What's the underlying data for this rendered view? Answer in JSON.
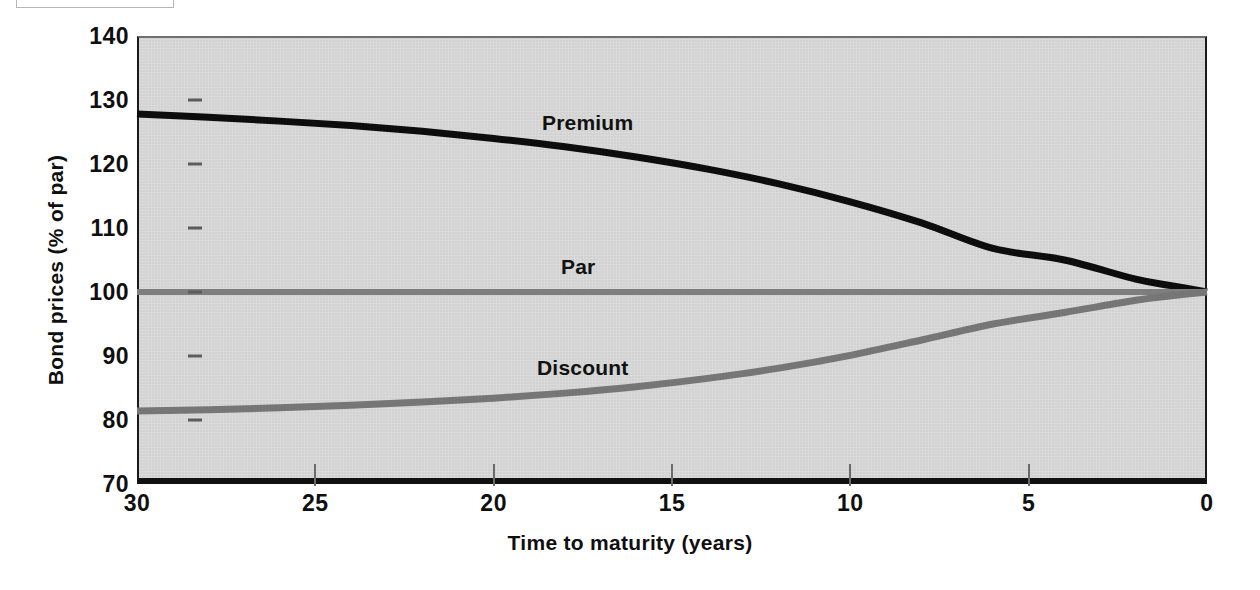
{
  "figure": {
    "background_color": "#ffffff",
    "plot_background_color": "#d5d5d5"
  },
  "axis": {
    "y_title": "Bond prices (% of par)",
    "x_title": "Time to maturity (years)",
    "y_ticks": [
      "140",
      "130",
      "120",
      "110",
      "100",
      "90",
      "80",
      "70"
    ],
    "x_ticks": [
      "30",
      "25",
      "20",
      "15",
      "10",
      "5",
      "0"
    ]
  },
  "series_labels": {
    "premium": "Premium",
    "par": "Par",
    "discount": "Discount"
  },
  "chart_data": {
    "type": "line",
    "title": "",
    "xlabel": "Time to maturity (years)",
    "ylabel": "Bond prices (% of par)",
    "xlim": [
      30,
      0
    ],
    "ylim": [
      70,
      140
    ],
    "x_reversed": true,
    "grid": false,
    "legend_position": "inline-annotations",
    "x_ticks": [
      30,
      25,
      20,
      15,
      10,
      5,
      0
    ],
    "y_ticks": [
      70,
      80,
      90,
      100,
      110,
      120,
      130,
      140
    ],
    "x": [
      30,
      28,
      26,
      24,
      22,
      20,
      18,
      16,
      14,
      12,
      10,
      8,
      6,
      4,
      2,
      1,
      0
    ],
    "series": [
      {
        "name": "Premium",
        "color": "#0d0d0d",
        "line_width": 7,
        "values": [
          127.8,
          127.3,
          126.7,
          126.0,
          125.1,
          124.0,
          122.7,
          121.1,
          119.2,
          116.9,
          114.1,
          110.8,
          106.8,
          105.0,
          102.0,
          101.0,
          100.0
        ]
      },
      {
        "name": "Par",
        "color": "#7e7e7e",
        "line_width": 6,
        "values": [
          100,
          100,
          100,
          100,
          100,
          100,
          100,
          100,
          100,
          100,
          100,
          100,
          100,
          100,
          100,
          100,
          100
        ]
      },
      {
        "name": "Discount",
        "color": "#767676",
        "line_width": 7,
        "values": [
          81.4,
          81.6,
          81.9,
          82.3,
          82.8,
          83.4,
          84.2,
          85.2,
          86.5,
          88.1,
          90.1,
          92.5,
          95.0,
          96.8,
          98.7,
          99.4,
          100.0
        ]
      }
    ],
    "annotations": [
      {
        "text": "Premium",
        "x": 18.5,
        "y": 133.5
      },
      {
        "text": "Par",
        "x": 18.0,
        "y": 106.5
      },
      {
        "text": "Discount",
        "x": 19.0,
        "y": 91.5
      }
    ]
  }
}
